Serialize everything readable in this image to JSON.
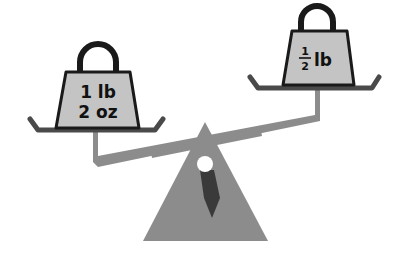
{
  "diagram": {
    "type": "balance-scale",
    "left_weight": {
      "line1": "1 lb",
      "line2": "2 oz"
    },
    "right_weight": {
      "fraction_numerator": "1",
      "fraction_denominator": "2",
      "unit": "lb"
    },
    "state": "left side heavier (tilted down on left)"
  },
  "colors": {
    "weight_fill": "#c4c4c4",
    "outline": "#1a1a1a",
    "beam": "#8c8c8c",
    "fulcrum": "#8c8c8c",
    "pointer": "#3a3a3a",
    "pivot": "#ffffff",
    "pan": "#4a4a4a"
  }
}
